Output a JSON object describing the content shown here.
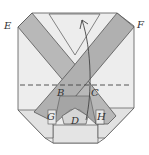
{
  "diagram": {
    "type": "origami-fold-diagram",
    "labels": {
      "E": "E",
      "F": "F",
      "B": "B",
      "C": "C",
      "D": "D",
      "G": "G",
      "H": "H"
    },
    "colors": {
      "paper": "#ededed",
      "paper_shadow": "#dcdcdc",
      "band": "#b8b8b8",
      "band_dark": "#a5a5a5",
      "line": "#555555"
    },
    "annotations": {
      "fold_line": "dashed horizontal valley fold through B and C",
      "arrow": "curved arrow pointing upward indicating fold direction"
    }
  }
}
